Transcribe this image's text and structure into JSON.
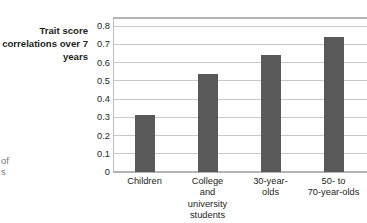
{
  "fragments": {
    "left_top": "of",
    "left_bottom": "s"
  },
  "axis_caption": "Trait score correlations over 7 years",
  "chart_data": {
    "type": "bar",
    "title": "",
    "xlabel": "",
    "ylabel": "Trait score correlations over 7 years",
    "categories": [
      "Children",
      "College and university students",
      "30-year-olds",
      "50- to 70-year-olds"
    ],
    "category_lines": [
      [
        "Children"
      ],
      [
        "College",
        "and",
        "university",
        "students"
      ],
      [
        "30-year-",
        "olds"
      ],
      [
        "50-  to",
        "70-year-olds"
      ]
    ],
    "values": [
      0.31,
      0.54,
      0.64,
      0.74
    ],
    "ylim": [
      0,
      0.85
    ],
    "yticks": [
      0.8,
      0.7,
      0.6,
      0.5,
      0.4,
      0.3,
      0.2,
      0.1,
      0
    ],
    "ytick_labels": [
      "0.8",
      "0.7",
      "0.6",
      "0.5",
      "0.4",
      "0.3",
      "0.2",
      "0.1",
      "0"
    ],
    "grid": true,
    "legend": "none",
    "bar_color": "#595959",
    "grid_color": "#c9c9c9",
    "frame_color": "#b4b4b4"
  }
}
